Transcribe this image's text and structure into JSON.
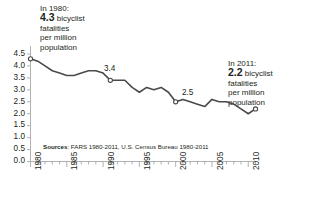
{
  "annotations": {
    "left": {
      "line1": "In 1980:",
      "value": "4.3",
      "rest1": " bicyclist",
      "line3": "fatalities",
      "line4": "per million",
      "line5": "population"
    },
    "right": {
      "line1": "In 2011:",
      "value": "2.2",
      "rest1": " bicyclist",
      "line3": "fatalities",
      "line4": "per million",
      "line5": "population"
    }
  },
  "sources": {
    "label": "Sources",
    "text": ": FARS 1980-2011, U.S. Census Bureau 1980-2011"
  },
  "point_labels": {
    "p1990": "3.4",
    "p2000": "2.5"
  },
  "colors": {
    "line": "#4a4a4a",
    "axis": "#a7a9ac",
    "text": "#231f20",
    "background": "#ffffff"
  },
  "chart_data": {
    "type": "line",
    "title": "",
    "xlabel": "",
    "ylabel": "",
    "xlim": [
      1980,
      2011
    ],
    "ylim": [
      0.0,
      4.5
    ],
    "grid": false,
    "legend": false,
    "ytick_labels": [
      "4.5",
      "4.0",
      "3.5",
      "3.0",
      "2.5",
      "2.0",
      "1.5",
      "1.0",
      "0.5",
      "0.0"
    ],
    "yticks": [
      4.5,
      4.0,
      3.5,
      3.0,
      2.5,
      2.0,
      1.5,
      1.0,
      0.5,
      0.0
    ],
    "xtick_labels": [
      "1980",
      "1985",
      "1990",
      "1995",
      "2000",
      "2005",
      "2010"
    ],
    "xticks": [
      1980,
      1985,
      1990,
      1995,
      2000,
      2005,
      2010
    ],
    "minor_xticks_every": 1,
    "x": [
      1980,
      1981,
      1982,
      1983,
      1984,
      1985,
      1986,
      1987,
      1988,
      1989,
      1990,
      1991,
      1992,
      1993,
      1994,
      1995,
      1996,
      1997,
      1998,
      1999,
      2000,
      2001,
      2002,
      2003,
      2004,
      2005,
      2006,
      2007,
      2008,
      2009,
      2010,
      2011
    ],
    "values": [
      4.3,
      4.2,
      4.0,
      3.8,
      3.7,
      3.6,
      3.6,
      3.7,
      3.8,
      3.8,
      3.7,
      3.4,
      3.4,
      3.4,
      3.1,
      2.9,
      3.1,
      3.0,
      3.1,
      2.9,
      2.5,
      2.6,
      2.5,
      2.4,
      2.3,
      2.6,
      2.5,
      2.5,
      2.4,
      2.2,
      2.0,
      2.2
    ],
    "series_name": "Bicyclist fatalities per million population",
    "annotated_points": [
      {
        "x": 1980,
        "y": 4.3,
        "label": "4.3",
        "marker": "open-circle"
      },
      {
        "x": 1991,
        "y": 3.4,
        "label": "3.4",
        "marker": "open-circle"
      },
      {
        "x": 2000,
        "y": 2.5,
        "label": "2.5",
        "marker": "open-circle"
      },
      {
        "x": 2011,
        "y": 2.2,
        "label": "2.2",
        "marker": "open-circle"
      }
    ]
  }
}
